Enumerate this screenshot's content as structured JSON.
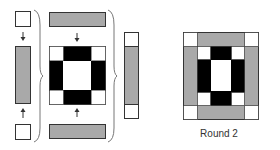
{
  "diagram": {
    "title_label": "Round 2",
    "colors": {
      "gray_fill": "#a9a9a9",
      "black_fill": "#000000",
      "white_fill": "#ffffff",
      "stroke": "#333333",
      "brace": "#777777"
    },
    "steps": [
      {
        "id": "left-column",
        "pieces": [
          "white square",
          "gray strip",
          "white square"
        ],
        "arrows": [
          "down",
          "up"
        ]
      },
      {
        "id": "middle-column",
        "pieces": [
          "gray bar",
          "round-1 block",
          "gray bar"
        ],
        "arrows": [
          "down",
          "up"
        ]
      },
      {
        "id": "joined-strip",
        "pieces": [
          "white square",
          "gray strip",
          "white square"
        ]
      },
      {
        "id": "result",
        "label": "Round 2"
      }
    ]
  }
}
